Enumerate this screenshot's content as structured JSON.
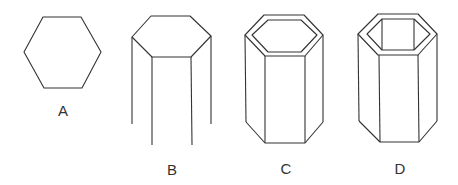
{
  "figures": [
    {
      "id": "A",
      "label": "A",
      "description": "flat hexagon"
    },
    {
      "id": "B",
      "label": "B",
      "description": "hexagonal prism wireframe with open bottom edges"
    },
    {
      "id": "C",
      "label": "C",
      "description": "hollow hexagonal prism with inner top rim"
    },
    {
      "id": "D",
      "label": "D",
      "description": "hollow hexagonal prism with visible inner walls"
    }
  ],
  "stroke_color": "#333333"
}
